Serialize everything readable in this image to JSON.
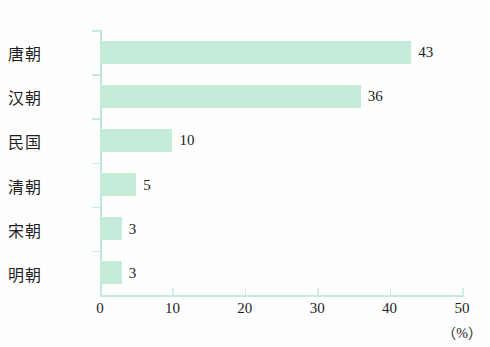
{
  "chart_data": {
    "type": "bar",
    "orientation": "horizontal",
    "title": "",
    "subtitle": "",
    "xlabel": "（%）",
    "ylabel": "",
    "categories": [
      "唐朝",
      "汉朝",
      "民国",
      "清朝",
      "宋朝",
      "明朝"
    ],
    "values": [
      43,
      36,
      10,
      5,
      3,
      3
    ],
    "value_labels": [
      "43",
      "36",
      "10",
      "5",
      "3",
      "3"
    ],
    "xlim": [
      0,
      50
    ],
    "xticks": [
      0,
      10,
      20,
      30,
      40,
      50
    ],
    "xtick_labels": [
      "0",
      "10",
      "20",
      "30",
      "40",
      "50"
    ],
    "grid": false,
    "legend": null,
    "bar_color": "#c4ecd9",
    "axis_color": "#c6ece0",
    "text_color": "#1c1c1c"
  },
  "axis": {
    "unit_label": "（%）"
  }
}
